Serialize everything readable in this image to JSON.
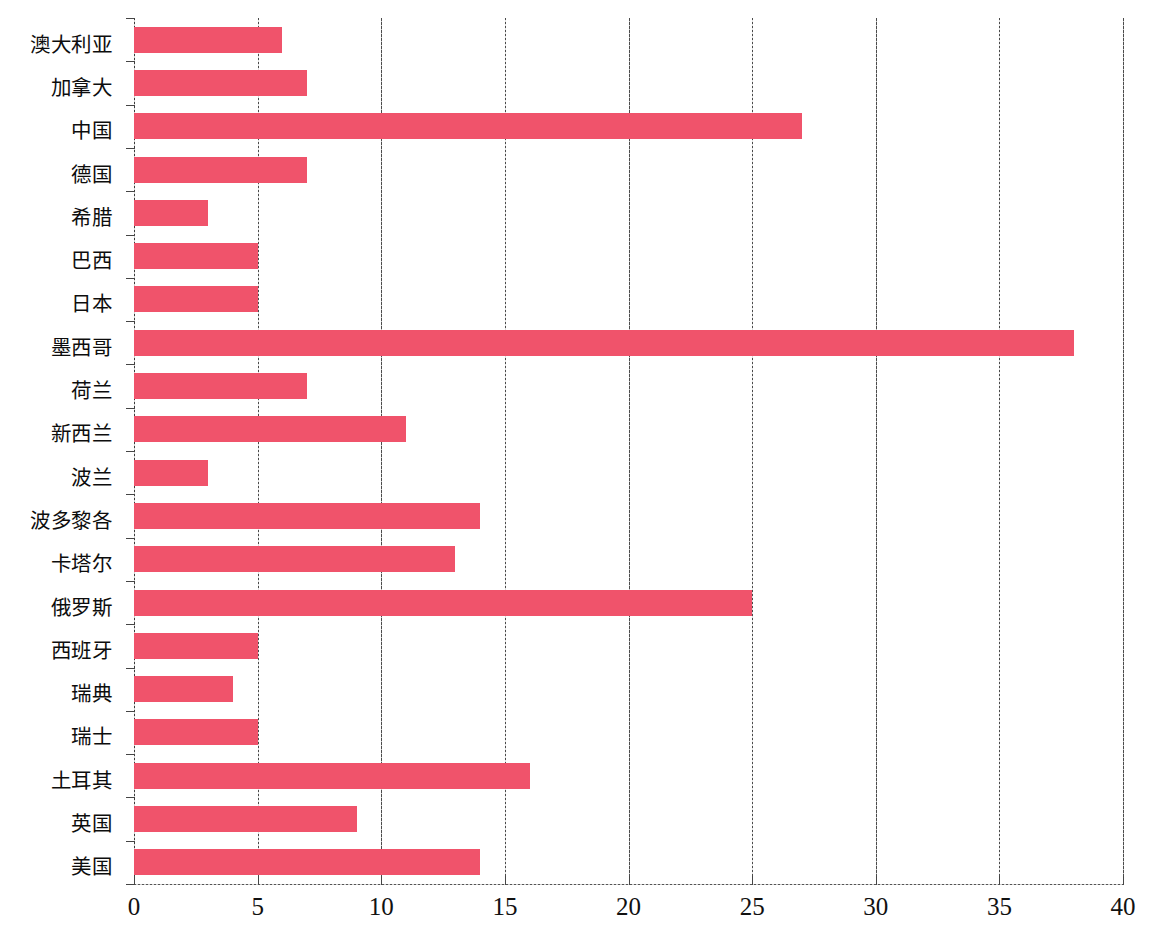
{
  "chart_data": {
    "type": "bar",
    "orientation": "horizontal",
    "title": "",
    "subtitle": "",
    "xlabel": "",
    "ylabel": "",
    "xlim": [
      0,
      40
    ],
    "xticks": [
      0,
      5,
      10,
      15,
      20,
      25,
      30,
      35,
      40
    ],
    "xtick_labels": [
      "0",
      "5",
      "10",
      "15",
      "20",
      "25",
      "30",
      "35",
      "40"
    ],
    "grid": "vertical",
    "legend": "none",
    "bar_color": "#F0536B",
    "categories": [
      "澳大利亚",
      "加拿大",
      "中国",
      "德国",
      "希腊",
      "巴西",
      "日本",
      "墨西哥",
      "荷兰",
      "新西兰",
      "波兰",
      "波多黎各",
      "卡塔尔",
      "俄罗斯",
      "西班牙",
      "瑞典",
      "瑞士",
      "土耳其",
      "英国",
      "美国"
    ],
    "values": [
      6,
      7,
      27,
      7,
      3,
      5,
      5,
      38,
      7,
      11,
      3,
      14,
      13,
      25,
      5,
      4,
      5,
      16,
      9,
      14
    ]
  }
}
